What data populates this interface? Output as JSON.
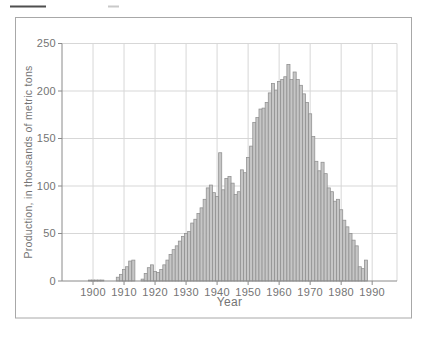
{
  "chart_data": {
    "type": "bar",
    "title": "",
    "xlabel": "Year",
    "ylabel": "Production, in thousands of metric tons",
    "xlim": [
      1890,
      1998
    ],
    "ylim": [
      0,
      250
    ],
    "xticks": [
      1900,
      1910,
      1920,
      1930,
      1940,
      1950,
      1960,
      1970,
      1980,
      1990
    ],
    "yticks": [
      0,
      50,
      100,
      150,
      200,
      250
    ],
    "grid": true,
    "legend": "none",
    "x": [
      1899,
      1900,
      1901,
      1902,
      1903,
      1904,
      1905,
      1906,
      1907,
      1908,
      1909,
      1910,
      1911,
      1912,
      1913,
      1914,
      1915,
      1916,
      1917,
      1918,
      1919,
      1920,
      1921,
      1922,
      1923,
      1924,
      1925,
      1926,
      1927,
      1928,
      1929,
      1930,
      1931,
      1932,
      1933,
      1934,
      1935,
      1936,
      1937,
      1938,
      1939,
      1940,
      1941,
      1942,
      1943,
      1944,
      1945,
      1946,
      1947,
      1948,
      1949,
      1950,
      1951,
      1952,
      1953,
      1954,
      1955,
      1956,
      1957,
      1958,
      1959,
      1960,
      1961,
      1962,
      1963,
      1964,
      1965,
      1966,
      1967,
      1968,
      1969,
      1970,
      1971,
      1972,
      1973,
      1974,
      1975,
      1976,
      1977,
      1978,
      1979,
      1980,
      1981,
      1982,
      1983,
      1984,
      1985,
      1986,
      1987,
      1988
    ],
    "values": [
      1,
      1,
      1,
      1,
      1,
      0,
      0,
      0,
      0,
      4,
      7,
      12,
      15,
      21,
      22,
      0,
      0,
      2,
      8,
      14,
      17,
      10,
      9,
      12,
      17,
      22,
      28,
      33,
      37,
      42,
      47,
      50,
      52,
      61,
      65,
      71,
      77,
      86,
      98,
      101,
      93,
      89,
      135,
      96,
      108,
      110,
      103,
      91,
      94,
      117,
      114,
      130,
      142,
      167,
      172,
      181,
      182,
      188,
      198,
      208,
      201,
      210,
      212,
      215,
      228,
      212,
      220,
      212,
      206,
      197,
      188,
      176,
      152,
      126,
      116,
      125,
      113,
      98,
      94,
      84,
      86,
      75,
      64,
      57,
      50,
      43,
      37,
      15,
      13,
      22
    ],
    "colors": {
      "bar_fill": "#c6c6c6",
      "bar_stroke": "#8f8f8f",
      "grid": "#d7d7d7",
      "axis": "#8a8a8a",
      "text": "#747474",
      "frame": "#a8a8a8",
      "background": "#ffffff"
    }
  }
}
